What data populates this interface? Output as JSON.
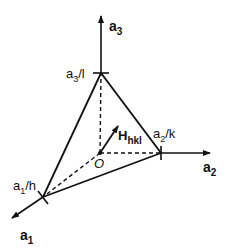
{
  "diagram": {
    "axes": [
      {
        "id": "a1",
        "label": "a",
        "sub": "1"
      },
      {
        "id": "a2",
        "label": "a",
        "sub": "2"
      },
      {
        "id": "a3",
        "label": "a",
        "sub": "3"
      }
    ],
    "intercepts": [
      {
        "id": "a1h",
        "label": "a",
        "sub": "1",
        "suffix": "/h"
      },
      {
        "id": "a2k",
        "label": "a",
        "sub": "2",
        "suffix": "/k"
      },
      {
        "id": "a3l",
        "label": "a",
        "sub": "3",
        "suffix": "/l"
      }
    ],
    "origin_label": "O",
    "vector": {
      "label": "H",
      "sub": "hkl"
    },
    "colors": {
      "line": "#111111",
      "background": "#ffffff"
    }
  }
}
